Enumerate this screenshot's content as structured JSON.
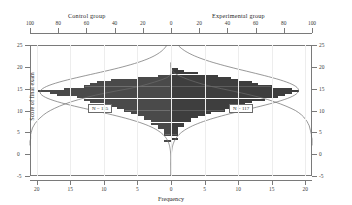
{
  "titles": {
    "control": "Control group",
    "experimental": "Experimental group"
  },
  "axes": {
    "y_label": "Score of final exam",
    "x_label": "Frequency",
    "y_ticks": [
      "25",
      "20",
      "15",
      "10",
      "5",
      "0",
      "-5"
    ],
    "y_values": [
      25,
      20,
      15,
      10,
      5,
      0,
      -5
    ],
    "x_bottom_ticks": [
      "20",
      "15",
      "10",
      "5",
      "0",
      "5",
      "10",
      "15",
      "20"
    ],
    "x_top_ticks": [
      "100",
      "80",
      "60",
      "40",
      "20",
      "0",
      "20",
      "40",
      "60",
      "80",
      "100"
    ]
  },
  "annotations": {
    "control_n": "N = 115",
    "experimental_n": "N = 117"
  },
  "colors": {
    "bar_control": "#6e6e6e",
    "bar_experimental": "#5d5d5d",
    "frame": "#7a7a7a",
    "curve": "#6b6b6b",
    "midline": "#a8a8a8"
  },
  "chart_data": {
    "type": "bar",
    "title": "",
    "subtitle": "",
    "orientation": "horizontal-back-to-back-population-pyramid",
    "xlabel": "Frequency",
    "ylabel": "Score of final exam",
    "xlim": [
      -21,
      21
    ],
    "ylim": [
      -5,
      25
    ],
    "grid": false,
    "legend_position": "top",
    "secondary_axis": {
      "name": "Cumulative percent",
      "position": "top",
      "xlim_left": [
        100,
        0
      ],
      "xlim_right": [
        0,
        100
      ],
      "ticks": [
        0,
        20,
        40,
        60,
        80,
        100
      ]
    },
    "categories": [
      21,
      20.5,
      20,
      19.5,
      19,
      18.5,
      18,
      17.5,
      17,
      16.5,
      16,
      15.5,
      15,
      14.5,
      14,
      13.5,
      13,
      12.5,
      12,
      11.5,
      11,
      10.5,
      10,
      9.5,
      9,
      8.5,
      8,
      7.5,
      7,
      6.5,
      6,
      5.5,
      5,
      4.5,
      4,
      3.5,
      3,
      2.5,
      2
    ],
    "series": [
      {
        "name": "Control group",
        "direction": "left",
        "n": 115,
        "values": [
          0,
          0,
          0,
          0,
          0,
          0,
          2,
          5,
          9,
          11,
          12,
          13,
          16,
          20,
          18,
          17,
          14,
          13,
          12,
          10,
          9,
          8,
          7,
          6,
          5,
          4,
          4,
          3,
          3,
          2,
          2,
          1,
          1,
          1,
          0,
          0,
          1,
          0,
          0
        ]
      },
      {
        "name": "Experimental group",
        "direction": "right",
        "n": 117,
        "values": [
          0,
          0,
          0,
          1,
          2,
          4,
          7,
          9,
          10,
          12,
          13,
          15,
          18,
          19,
          18,
          17,
          16,
          14,
          12,
          11,
          10,
          9,
          8,
          6,
          5,
          4,
          3,
          3,
          2,
          2,
          1,
          1,
          1,
          1,
          0,
          1,
          0,
          0,
          0
        ]
      }
    ],
    "overlay_curves": [
      {
        "name": "Control cumulative %",
        "side": "left"
      },
      {
        "name": "Experimental cumulative %",
        "side": "right"
      },
      {
        "name": "Control normal fit",
        "side": "left"
      },
      {
        "name": "Experimental normal fit",
        "side": "right"
      }
    ]
  }
}
